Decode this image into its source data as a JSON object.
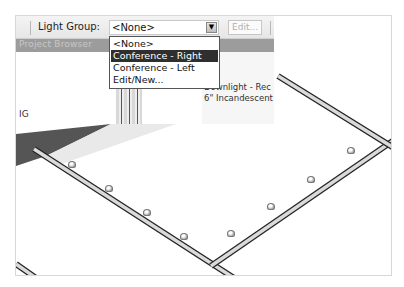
{
  "toolbar": {
    "light_group_label": "Light Group:",
    "light_group_value": "<None>",
    "dropdown_arrow_icon": "chevron-down-icon",
    "edit_button_label": "Edit..."
  },
  "dropdown": {
    "options": [
      {
        "label": "<None>",
        "selected": false
      },
      {
        "label": "Conference - Right",
        "selected": true
      },
      {
        "label": "Conference - Left",
        "selected": false
      },
      {
        "label": "Edit/New...",
        "selected": false
      }
    ]
  },
  "project_browser": {
    "title": "Project Browser"
  },
  "properties": {
    "line1": "Downlight - Rec",
    "line2": "6\" Incandescent"
  },
  "left_panel": {
    "fragment_label": "IG"
  },
  "viewport": {
    "lights_count": 8
  },
  "colors": {
    "selection": "#2f2f2f",
    "browser_bar": "#9c9c9c",
    "beam": "#333333"
  }
}
